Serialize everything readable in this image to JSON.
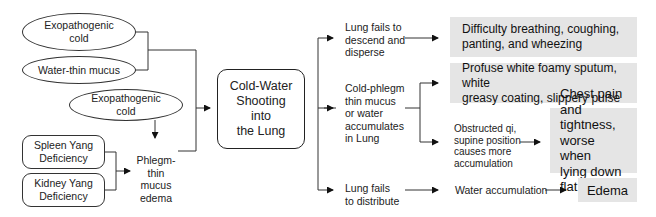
{
  "diagram": {
    "title": "Cold-Water Shooting into the Lung",
    "causes": {
      "exopathogenic_cold_top": "Exopathogenic\ncold",
      "water_thin_mucus": "Water-thin mucus",
      "exopathogenic_cold_bottom": "Exopathogenic\ncold",
      "spleen_yang": "Spleen Yang\nDeficiency",
      "kidney_yang": "Kidney Yang\nDeficiency",
      "phlegm_edema": "Phlegm-\nthin mucus\nedema"
    },
    "center": "Cold-Water\nShooting\ninto\nthe Lung",
    "mechanisms": {
      "descend": "Lung fails to\ndescend and\ndisperse",
      "accumulates": "Cold-phlegm\nthin mucus\nor water\naccumulates\nin Lung",
      "obstructed": "Obstructed qi,\nsupine position\ncauses more\naccumulation",
      "distribute": "Lung fails\nto distribute",
      "water_accumulation": "Water accumulation"
    },
    "results": {
      "breathing": "Difficulty breathing, coughing,\npanting, and wheezing",
      "sputum": "Profuse white foamy sputum, white\ngreasy coating, slippery pulse",
      "chest": "Chest pain\nand tightness,\nworse when\nlying down flat",
      "edema": "Edema"
    }
  }
}
